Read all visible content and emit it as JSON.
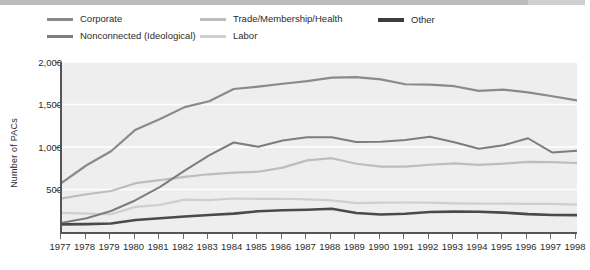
{
  "chart_data": {
    "type": "line",
    "title": "",
    "xlabel": "",
    "ylabel": "Number of PACs",
    "ylim": [
      0,
      2000
    ],
    "yticks": [
      500,
      1000,
      1500,
      2000
    ],
    "ytick_labels": [
      "500",
      "1,000",
      "1,500",
      "2,000"
    ],
    "grid": "horizontal-white-gridlines",
    "legend_position": "top",
    "x": [
      1977,
      1978,
      1979,
      1980,
      1981,
      1982,
      1983,
      1984,
      1985,
      1986,
      1987,
      1988,
      1989,
      1990,
      1991,
      1992,
      1993,
      1994,
      1995,
      1996,
      1997,
      1998
    ],
    "xtick_labels": [
      "1977",
      "1978",
      "1979",
      "1980",
      "1981",
      "1982",
      "1983",
      "1984",
      "1985",
      "1986",
      "1987",
      "1988",
      "1989",
      "1990",
      "1991",
      "1992",
      "1993",
      "1994",
      "1995",
      "1996",
      "1997",
      "1998"
    ],
    "series": [
      {
        "name": "Corporate",
        "color": "#8a8a8a",
        "width": 2.2,
        "values": [
          580,
          785,
          950,
          1204,
          1329,
          1469,
          1538,
          1682,
          1710,
          1744,
          1775,
          1816,
          1821,
          1795,
          1738,
          1735,
          1715,
          1660,
          1674,
          1642,
          1597,
          1548
        ]
      },
      {
        "name": "Nonconnected (Ideological)",
        "color": "#7d7d7d",
        "width": 2.0,
        "values": [
          110,
          162,
          247,
          374,
          531,
          723,
          902,
          1053,
          1003,
          1077,
          1115,
          1115,
          1060,
          1062,
          1083,
          1121,
          1055,
          980,
          1020,
          1103,
          935,
          955
        ]
      },
      {
        "name": "Trade/Membership/Health",
        "color": "#bdbdbd",
        "width": 2.2,
        "values": [
          395,
          444,
          482,
          574,
          611,
          649,
          679,
          698,
          709,
          757,
          843,
          868,
          803,
          769,
          768,
          791,
          807,
          790,
          804,
          826,
          822,
          812
        ]
      },
      {
        "name": "Labor",
        "color": "#cfcfcf",
        "width": 2.2,
        "values": [
          224,
          217,
          209,
          296,
          320,
          380,
          374,
          394,
          390,
          391,
          385,
          372,
          340,
          346,
          347,
          346,
          337,
          333,
          334,
          332,
          331,
          321
        ]
      },
      {
        "name": "Other",
        "color": "#4a4a4a",
        "width": 2.6,
        "values": [
          90,
          93,
          100,
          141,
          162,
          183,
          200,
          216,
          244,
          256,
          262,
          274,
          224,
          205,
          215,
          235,
          240,
          238,
          228,
          210,
          200,
          198
        ]
      }
    ]
  },
  "legend": {
    "items": [
      {
        "label": "Corporate",
        "color": "#8a8a8a"
      },
      {
        "label": "Nonconnected (Ideological)",
        "color": "#7d7d7d"
      },
      {
        "label": "Trade/Membership/Health",
        "color": "#bdbdbd"
      },
      {
        "label": "Labor",
        "color": "#cfcfcf"
      },
      {
        "label": "Other",
        "color": "#3c3c3c"
      }
    ]
  },
  "axes": {
    "y_title": "Number of PACs",
    "y_ticks": [
      "2,000",
      "1,500",
      "1,000",
      "500"
    ],
    "x_ticks": [
      "1977",
      "1978",
      "1979",
      "1980",
      "1981",
      "1982",
      "1983",
      "1984",
      "1985",
      "1986",
      "1987",
      "1988",
      "1989",
      "1990",
      "1991",
      "1992",
      "1993",
      "1994",
      "1995",
      "1996",
      "1997",
      "1998"
    ]
  },
  "colors": {
    "plot_background": "#eeeeee",
    "gridline": "#ffffff",
    "axis": "#555555",
    "text": "#2b2b2b",
    "page_background": "#ffffff",
    "top_rule": "#c4c4c4"
  }
}
